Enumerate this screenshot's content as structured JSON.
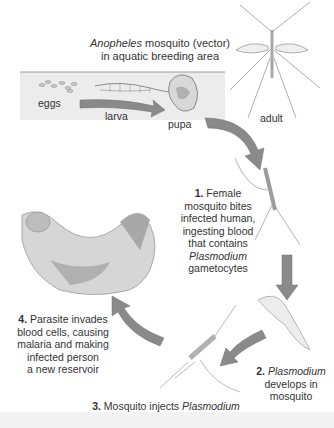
{
  "title": {
    "line1_italic": "Anopheles",
    "line1_rest": " mosquito (vector)",
    "line2": "in aquatic breeding area"
  },
  "stages": {
    "eggs": "eggs",
    "larva": "larva",
    "pupa": "pupa",
    "adult": "adult"
  },
  "steps": [
    {
      "number": "1.",
      "lines": [
        "Female",
        "mosquito bites",
        "infected human,",
        "ingesting blood",
        "that contains"
      ],
      "italic": "Plasmodium",
      "tail": "gametocytes"
    },
    {
      "number": "2.",
      "italic": "Plasmodium",
      "lines": [
        "develops in",
        "mosquito"
      ]
    },
    {
      "number": "3.",
      "text_a": " Mosquito injects ",
      "italic": "Plasmodium",
      "line2": "sporozoites into human host"
    },
    {
      "number": "4.",
      "text_a": " Parasite invades",
      "lines": [
        "blood cells, causing",
        "malaria and making",
        "infected person",
        "a new reservoir"
      ]
    }
  ],
  "colors": {
    "arrow": "#8a8a8a",
    "arrow_edge": "#6f6f6f",
    "water": "#e6e6e6",
    "waterline": "#9a9a9a",
    "sketch": "#b5b5b5"
  }
}
